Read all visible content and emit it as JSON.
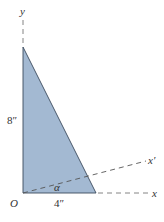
{
  "figure": {
    "type": "geometry-diagram",
    "shape": "right-triangle",
    "fill_color": "#a3b9d2",
    "edge_color": "#3a4a5c",
    "axis_color": "#666666"
  },
  "labels": {
    "y_axis": "y",
    "x_axis": "x",
    "x_prime_axis": "x′",
    "origin": "O",
    "height": "8″",
    "base": "4″",
    "angle": "α"
  },
  "dimensions": {
    "height_in": 8,
    "base_in": 4
  }
}
